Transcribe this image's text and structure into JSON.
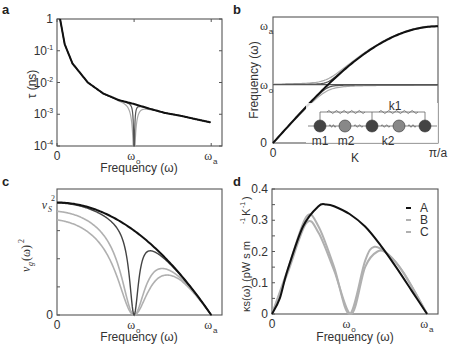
{
  "figure": {
    "panels": [
      "a",
      "b",
      "c",
      "d"
    ]
  },
  "chart_data": [
    {
      "panel": "a",
      "type": "line",
      "title": "",
      "xlabel": "Frequency (ω)",
      "ylabel": "τ (ns)",
      "yscale": "log",
      "ylim": [
        0.0001,
        1
      ],
      "xlim": [
        0,
        1.07
      ],
      "x_ticks": [
        {
          "pos": 0,
          "label": "0"
        },
        {
          "pos": 0.5,
          "label": "ωo"
        },
        {
          "pos": 1.0,
          "label": "ωa"
        }
      ],
      "y_ticks": [
        {
          "pos": 1,
          "label": "1"
        },
        {
          "pos": 0.1,
          "label": "10-1"
        },
        {
          "pos": 0.01,
          "label": "10-2"
        },
        {
          "pos": 0.001,
          "label": "10-3"
        },
        {
          "pos": 0.0001,
          "label": "10-4"
        }
      ],
      "series": [
        {
          "name": "A",
          "color": "#111111",
          "width": 2.0,
          "description": "τ ~ 1/ω² decay from 1 at ω≈0.02 to ~5.5e-4 at ωa",
          "x": [
            0.02,
            0.05,
            0.1,
            0.2,
            0.3,
            0.4,
            0.5,
            0.6,
            0.7,
            0.8,
            0.9,
            1.0
          ],
          "y": [
            1.0,
            0.16,
            0.04,
            0.01,
            0.0045,
            0.0028,
            0.0021,
            0.0015,
            0.0011,
            0.0009,
            0.0007,
            0.00055
          ]
        },
        {
          "name": "B",
          "color": "#555555",
          "width": 1.2,
          "description": "same as A but narrow resonance dip to 1e-4 at ωo",
          "dip_center": 0.5,
          "dip_width": 0.012
        },
        {
          "name": "C",
          "color": "#aaaaaa",
          "width": 1.2,
          "description": "same as A with wider dip at ωo",
          "dip_center": 0.5,
          "dip_width": 0.035
        }
      ]
    },
    {
      "panel": "b",
      "type": "line",
      "title": "",
      "xlabel": "K",
      "ylabel": "Frequency (ω)",
      "xlim": [
        0,
        1
      ],
      "ylim": [
        0,
        1.08
      ],
      "x_ticks": [
        {
          "pos": 0,
          "label": "0"
        },
        {
          "pos": 1,
          "label": "π/a"
        }
      ],
      "y_ticks": [
        {
          "pos": 0,
          "label": "0"
        },
        {
          "pos": 0.5,
          "label": "ωo"
        },
        {
          "pos": 1.0,
          "label": "ωa"
        }
      ],
      "series": [
        {
          "name": "A",
          "color": "#111111",
          "width": 2.0,
          "description": "acoustic branch ω = ωa·sin(πK/2)"
        },
        {
          "name": "B",
          "color": "#555555",
          "width": 1.2,
          "description": "avoided crossing with flat mode at ωo (small coupling)",
          "coupling": 0.025
        },
        {
          "name": "C",
          "color": "#aaaaaa",
          "width": 1.2,
          "description": "avoided crossing with flat mode at ωo (larger coupling)",
          "coupling": 0.05
        }
      ],
      "flat_mode": {
        "value": 0.5,
        "color": "#555555"
      },
      "inset": {
        "description": "mass-spring chain schematic",
        "labels": {
          "k1": "k1",
          "k2": "k2",
          "m1": "m1",
          "m2": "m2"
        },
        "masses": [
          "m1",
          "m2",
          "m1",
          "m2",
          "m1"
        ],
        "colors": {
          "m1": "#444444",
          "m2": "#888888"
        }
      }
    },
    {
      "panel": "c",
      "type": "line",
      "title": "",
      "xlabel": "Frequency (ω)",
      "ylabel": "vg(ω)²",
      "xlim": [
        0,
        1.07
      ],
      "ylim": [
        0,
        1.12
      ],
      "x_ticks": [
        {
          "pos": 0,
          "label": "0"
        },
        {
          "pos": 0.5,
          "label": "ωo"
        },
        {
          "pos": 1.0,
          "label": "ωa"
        }
      ],
      "y_ticks": [
        {
          "pos": 0,
          "label": "0"
        },
        {
          "pos": 1.0,
          "label": "vs²"
        }
      ],
      "series": [
        {
          "name": "A",
          "color": "#111111",
          "width": 2.0,
          "description": "vs²(1-ω²/ωa²), from vs² at 0 to 0 at ωa"
        },
        {
          "name": "B",
          "color": "#444444",
          "width": 1.4,
          "description": "drops to 0 at ωo, recovers to ~0.56 at 0.6ωa then merges",
          "scale": 1.0,
          "width_param": 0.06
        },
        {
          "name": "C1",
          "color": "#b0b0b0",
          "width": 1.6,
          "description": "lower start ~0.94, wider zero near ωo, secondary max ~0.38",
          "scale": 0.95,
          "width_param": 0.16
        },
        {
          "name": "C2",
          "color": "#b0b0b0",
          "width": 1.6,
          "description": "lower start ~0.88, secondary max ~0.33",
          "scale": 0.89,
          "width_param": 0.21
        }
      ]
    },
    {
      "panel": "d",
      "type": "line",
      "title": "",
      "xlabel": "Frequency (ω)",
      "ylabel": "κs(ω) (pW s m-1 K-1)",
      "xlim": [
        0,
        1.07
      ],
      "ylim": [
        0,
        0.4
      ],
      "x_ticks": [
        {
          "pos": 0,
          "label": "0"
        },
        {
          "pos": 0.5,
          "label": "ωo"
        },
        {
          "pos": 1.0,
          "label": "ωa"
        }
      ],
      "y_ticks": [
        {
          "pos": 0,
          "label": "0"
        },
        {
          "pos": 0.1,
          "label": "0.1"
        },
        {
          "pos": 0.2,
          "label": "0.2"
        },
        {
          "pos": 0.3,
          "label": "0.3"
        },
        {
          "pos": 0.4,
          "label": "0.4"
        }
      ],
      "legend": [
        {
          "label": "A",
          "color": "#111111"
        },
        {
          "label": "B",
          "color": "#b0b0b0"
        },
        {
          "label": "C",
          "color": "#b0b0b0"
        }
      ],
      "series": [
        {
          "name": "A",
          "color": "#111111",
          "width": 2.0,
          "description": "rises from 0, peak 0.35 at ω≈0.33ωa, falls to 0 at ωa",
          "x": [
            0,
            0.05,
            0.1,
            0.2,
            0.3,
            0.35,
            0.4,
            0.5,
            0.6,
            0.7,
            0.8,
            0.9,
            1.0
          ],
          "y": [
            0,
            0.05,
            0.14,
            0.28,
            0.345,
            0.35,
            0.345,
            0.32,
            0.28,
            0.22,
            0.15,
            0.075,
            0
          ]
        },
        {
          "name": "B",
          "color": "#b0b0b0",
          "width": 2.0,
          "description": "peak 0.31 at ≈0.22ωa, zero at ωo, secondary peak 0.21 at ≈0.66ωa",
          "x": [
            0,
            0.1,
            0.22,
            0.3,
            0.4,
            0.5,
            0.6,
            0.66,
            0.75,
            0.85,
            1.0
          ],
          "y": [
            0,
            0.14,
            0.31,
            0.28,
            0.15,
            0,
            0.17,
            0.215,
            0.19,
            0.13,
            0
          ]
        },
        {
          "name": "C",
          "color": "#b0b0b0",
          "width": 2.0,
          "description": "peak 0.29 at ≈0.22ωa, zero near ωo, secondary peak 0.20 at ≈0.68ωa",
          "x": [
            0,
            0.1,
            0.22,
            0.3,
            0.4,
            0.51,
            0.6,
            0.68,
            0.75,
            0.85,
            1.0
          ],
          "y": [
            0,
            0.13,
            0.29,
            0.26,
            0.14,
            0,
            0.15,
            0.2,
            0.19,
            0.13,
            0
          ]
        }
      ]
    }
  ],
  "labels": {
    "a": {
      "panel": "a",
      "ylabel": "τ (ns)",
      "xlabel": "Frequency (ω)"
    },
    "b": {
      "panel": "b",
      "ylabel": "Frequency (ω)",
      "xlabel": "K"
    },
    "c": {
      "panel": "c",
      "ylabel": "v",
      "xlabel": "Frequency  (ω)"
    },
    "d": {
      "panel": "d",
      "ylabel": "κs(ω) (pW s m",
      "xlabel": "Frequency  (ω)"
    }
  }
}
